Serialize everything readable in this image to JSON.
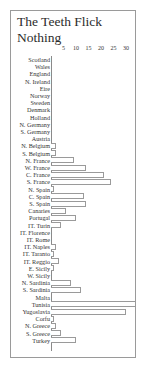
{
  "chart_data": {
    "type": "bar",
    "orientation": "horizontal",
    "title": "The Teeth Flick\nNothing",
    "xlabel": "",
    "ylabel": "",
    "xlim": [
      0,
      33
    ],
    "xticks": [
      5,
      10,
      15,
      20,
      25,
      30
    ],
    "grid": false,
    "legend": null,
    "categories": [
      "Scotland",
      "Wales",
      "England",
      "N. Ireland",
      "Eire",
      "Norway",
      "Sweden",
      "Denmark",
      "Holland",
      "N. Germany",
      "S. Germany",
      "Austria",
      "N. Belgium",
      "S. Belgium",
      "N. France",
      "W. France",
      "C. France",
      "S. France",
      "N. Spain",
      "C. Spain",
      "S. Spain",
      "Canaries",
      "Portugal",
      "IT. Turin",
      "IT. Florence",
      "IT. Rome",
      "IT. Naples",
      "IT. Taranto",
      "IT. Reggio",
      "E. Sicily",
      "W. Sicily",
      "N. Sardinia",
      "S. Sardinia",
      "Malta",
      "Tunisia",
      "Yugoslavia",
      "Corfu",
      "N. Greece",
      "S. Greece",
      "Turkey"
    ],
    "values": [
      0,
      0,
      0,
      0,
      0,
      0,
      0,
      0,
      0,
      0,
      0,
      0,
      2,
      2,
      9,
      14,
      21,
      24,
      1,
      13,
      14,
      6,
      10,
      4,
      0,
      0,
      2,
      1,
      3,
      1,
      0,
      8,
      12,
      0,
      34,
      30,
      1,
      2,
      4,
      10
    ]
  },
  "ui": {
    "title": "The Teeth Flick\nNothing",
    "tick_labels": [
      "5",
      "10",
      "15",
      "20",
      "25",
      "30"
    ]
  }
}
